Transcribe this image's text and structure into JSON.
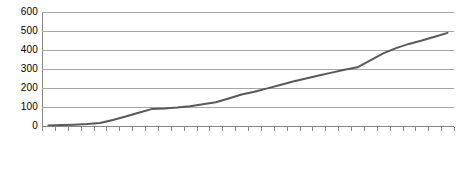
{
  "chart_data": {
    "type": "line",
    "title": "",
    "subtitle": "",
    "xlabel": "",
    "ylabel": "",
    "legend": [],
    "legend_position": "none",
    "grid": "horizontal",
    "ylim": [
      0,
      600
    ],
    "yticks": [
      0,
      100,
      200,
      300,
      400,
      500,
      600
    ],
    "ytick_labels": [
      "0",
      "100",
      "200",
      "300",
      "400",
      "500",
      "600"
    ],
    "categories": [
      "1980",
      "1981",
      "1982",
      "1983",
      "1984",
      "1985",
      "1986",
      "1987",
      "1988",
      "1989",
      "1990",
      "1991",
      "1992",
      "1993",
      "1994",
      "1995",
      "1996",
      "1997",
      "1998",
      "1999",
      "2000",
      "2001",
      "2002",
      "2003",
      "2004",
      "2005",
      "2006",
      "2007",
      "2008",
      "2009",
      "2010",
      "2011"
    ],
    "values": [
      3,
      5,
      7,
      10,
      16,
      32,
      50,
      70,
      89,
      92,
      97,
      104,
      114,
      125,
      145,
      166,
      180,
      198,
      216,
      234,
      250,
      266,
      281,
      296,
      309,
      345,
      382,
      410,
      432,
      450,
      470,
      490
    ],
    "series": [
      {
        "name": "",
        "color": "#595959",
        "line_width": 2,
        "values": [
          3,
          5,
          7,
          10,
          16,
          32,
          50,
          70,
          89,
          92,
          97,
          104,
          114,
          125,
          145,
          166,
          180,
          198,
          216,
          234,
          250,
          266,
          281,
          296,
          309,
          345,
          382,
          410,
          432,
          450,
          470,
          490
        ]
      }
    ]
  },
  "style": {
    "background": "#ffffff",
    "gridline_color": "#a6a6a6",
    "axis_color": "#868686",
    "text_color": "#000000",
    "line_color": "#595959"
  }
}
